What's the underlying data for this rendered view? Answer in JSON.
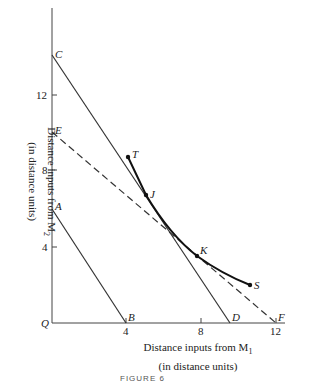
{
  "diagram": {
    "points": {
      "C": "C",
      "E": "E",
      "A": "A",
      "B": "B",
      "D": "D",
      "F": "F",
      "T": "T",
      "J": "J",
      "K": "K",
      "S": "S",
      "Q": "Q"
    },
    "x_ticks": [
      "4",
      "8",
      "12"
    ],
    "y_ticks": [
      "4",
      "8",
      "12"
    ],
    "x_axis_label_line1": "Distance inputs from M",
    "x_axis_label_sub": "1",
    "x_axis_label_line2": "(in distance units)",
    "y_axis_label_line1": "Distance inputs from M",
    "y_axis_label_sub": "2",
    "y_axis_label_line2": "(in distance units)",
    "caption": "FIGURE 6"
  }
}
